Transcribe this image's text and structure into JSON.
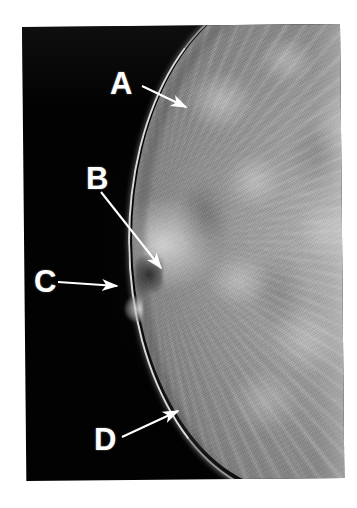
{
  "figure": {
    "kind": "mammogram-radiograph",
    "view": "craniocaudal-breast-projection",
    "background_color": "#ffffff",
    "film_color": "#020202",
    "annotation_color": "#ffffff"
  },
  "annotations": [
    {
      "id": "a",
      "label": "A",
      "name": "annotation-label-a",
      "target": "skin-line-upper-breast-contour",
      "label_position": {
        "x": 110,
        "y": 68
      },
      "arrow": {
        "x1": 142,
        "y1": 86,
        "x2": 188,
        "y2": 108
      }
    },
    {
      "id": "b",
      "label": "B",
      "name": "annotation-label-b",
      "target": "dense-fibroglandular-tissue-spiculated-density",
      "label_position": {
        "x": 86,
        "y": 163
      },
      "arrow": {
        "x1": 101,
        "y1": 192,
        "x2": 163,
        "y2": 270
      }
    },
    {
      "id": "c",
      "label": "C",
      "name": "annotation-label-c",
      "target": "nipple-in-profile",
      "label_position": {
        "x": 34,
        "y": 266
      },
      "arrow": {
        "x1": 58,
        "y1": 282,
        "x2": 119,
        "y2": 286
      }
    },
    {
      "id": "d",
      "label": "D",
      "name": "annotation-label-d",
      "target": "inferior-skin-line-inframammary-contour",
      "label_position": {
        "x": 94,
        "y": 424
      },
      "arrow": {
        "x1": 122,
        "y1": 437,
        "x2": 180,
        "y2": 409
      }
    }
  ],
  "image_region": {
    "left": 22,
    "top": 27,
    "width": 318,
    "height": 454,
    "rotation_deg": -0.55
  }
}
